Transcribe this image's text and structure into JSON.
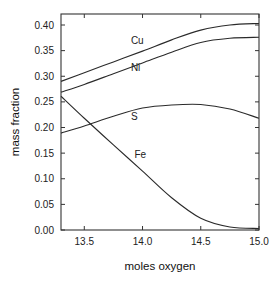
{
  "chart_data": {
    "type": "line",
    "title": "",
    "xlabel": "moles oxygen",
    "ylabel": "mass fraction",
    "xlim": [
      13.3,
      15.0
    ],
    "ylim": [
      0.0,
      0.42
    ],
    "grid": false,
    "legend": "inline labels",
    "x_ticks": [
      13.5,
      14.0,
      14.5,
      15.0
    ],
    "x_tick_labels": [
      "13.5",
      "14.0",
      "14.5",
      "15.0"
    ],
    "y_ticks": [
      0.0,
      0.05,
      0.1,
      0.15,
      0.2,
      0.25,
      0.3,
      0.35,
      0.4
    ],
    "y_tick_labels": [
      "0.00",
      "0.05",
      "0.10",
      "0.15",
      "0.20",
      "0.25",
      "0.30",
      "0.35",
      "0.40"
    ],
    "x": [
      13.3,
      13.5,
      13.75,
      14.0,
      14.25,
      14.5,
      14.75,
      15.0
    ],
    "series": [
      {
        "name": "Cu",
        "label_pos": [
          13.9,
          0.363
        ],
        "values": [
          0.29,
          0.307,
          0.328,
          0.349,
          0.371,
          0.39,
          0.4,
          0.403
        ]
      },
      {
        "name": "Ni",
        "label_pos": [
          13.9,
          0.311
        ],
        "values": [
          0.269,
          0.284,
          0.305,
          0.326,
          0.347,
          0.366,
          0.374,
          0.376
        ]
      },
      {
        "name": "S",
        "label_pos": [
          13.9,
          0.215
        ],
        "values": [
          0.189,
          0.203,
          0.222,
          0.238,
          0.244,
          0.245,
          0.236,
          0.218
        ]
      },
      {
        "name": "Fe",
        "label_pos": [
          13.93,
          0.14
        ],
        "values": [
          0.261,
          0.218,
          0.166,
          0.115,
          0.063,
          0.023,
          0.006,
          0.003
        ]
      }
    ]
  }
}
